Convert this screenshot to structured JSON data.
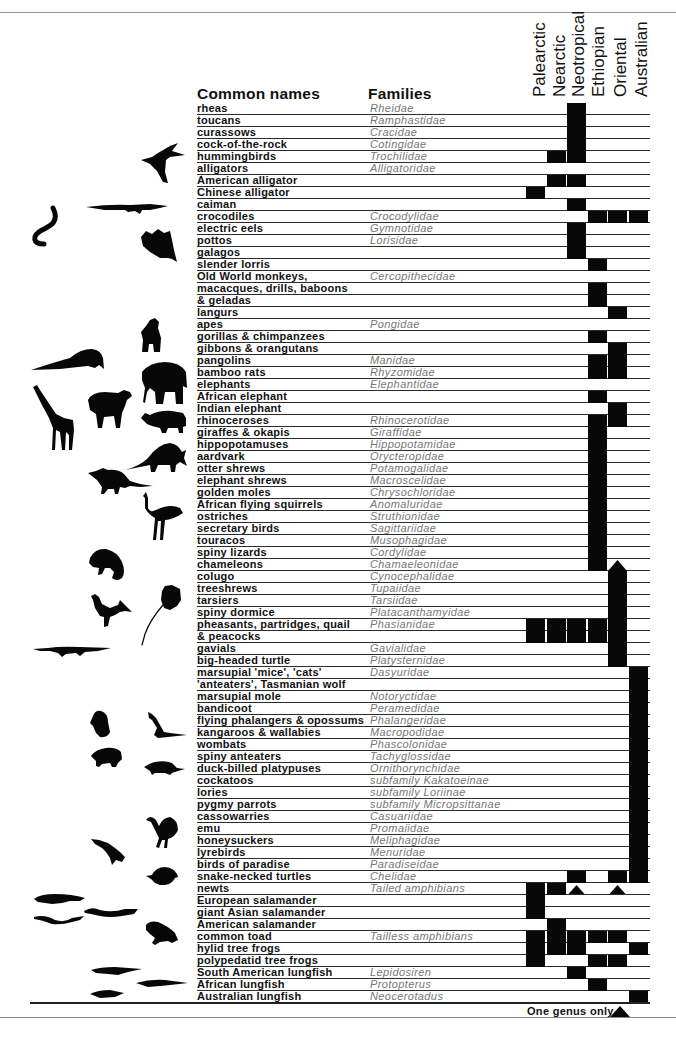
{
  "header": {
    "common_names": "Common names",
    "families": "Families"
  },
  "legend": {
    "label": "One genus only",
    "symbol": "triangle"
  },
  "icons": [
    "hummingbird-icon",
    "caiman-icon",
    "electric-eel-icon",
    "potto-icon",
    "gorilla-icon",
    "pangolin-icon",
    "indian-elephant-icon",
    "giraffe-icon",
    "african-elephant-icon",
    "rhinoceros-icon",
    "aardvark-icon",
    "elephant-shrew-icon",
    "ostrich-icon",
    "chameleon-icon",
    "pheasant-icon",
    "tarsier-icon",
    "gavial-icon",
    "koala-icon",
    "kangaroo-icon",
    "wombat-icon",
    "platypus-icon",
    "emu-icon",
    "bird-of-paradise-icon",
    "snake-necked-turtle-icon",
    "newt-icon",
    "salamander-icon",
    "giant-salamander-icon",
    "toad-icon",
    "south-american-lungfish-icon",
    "australian-lungfish-icon",
    "african-lungfish-icon"
  ],
  "chart_data": {
    "type": "table",
    "title": "",
    "columns": [
      "Palearctic",
      "Nearctic",
      "Neotropical",
      "Ethiopian",
      "Oriental",
      "Australian"
    ],
    "row_header_labels": [
      "Common names",
      "Families"
    ],
    "legend": [
      {
        "symbol": "filled square",
        "meaning": "present"
      },
      {
        "symbol": "triangle",
        "meaning": "One genus only"
      }
    ],
    "rows": [
      {
        "common_name": "rheas",
        "family": "Rheidae",
        "present": [
          "Neotropical"
        ]
      },
      {
        "common_name": "toucans",
        "family": "Ramphastidae",
        "present": [
          "Neotropical"
        ]
      },
      {
        "common_name": "curassows",
        "family": "Cracidae",
        "present": [
          "Neotropical"
        ]
      },
      {
        "common_name": "cock-of-the-rock",
        "family": "Cotingidae",
        "present": [
          "Neotropical"
        ]
      },
      {
        "common_name": "hummingbirds",
        "family": "Trochilidae",
        "present": [
          "Nearctic",
          "Neotropical"
        ]
      },
      {
        "common_name": "alligators",
        "family": "Alligatoridae",
        "present": []
      },
      {
        "common_name": "American alligator",
        "family": "",
        "present": [
          "Nearctic",
          "Neotropical"
        ]
      },
      {
        "common_name": "Chinese alligator",
        "family": "",
        "present": [
          "Palearctic"
        ]
      },
      {
        "common_name": "caiman",
        "family": "",
        "present": [
          "Neotropical"
        ]
      },
      {
        "common_name": "crocodiles",
        "family": "Crocodylidae",
        "present": [
          "Ethiopian",
          "Oriental",
          "Australian"
        ]
      },
      {
        "common_name": "electric eels",
        "family": "Gymnotidae",
        "present": [
          "Neotropical"
        ]
      },
      {
        "common_name": "pottos",
        "family": "Lorisidae",
        "present": [
          "Neotropical"
        ]
      },
      {
        "common_name": "galagos",
        "family": "",
        "present": [
          "Neotropical"
        ]
      },
      {
        "common_name": "slender lorris",
        "family": "",
        "present": [
          "Ethiopian"
        ]
      },
      {
        "common_name": "Old World monkeys,",
        "family": "Cercopithecidae",
        "present": []
      },
      {
        "common_name": "macacques, drills, baboons",
        "family": "",
        "present": [
          "Ethiopian"
        ]
      },
      {
        "common_name": "& geladas",
        "family": "",
        "present": [
          "Ethiopian"
        ]
      },
      {
        "common_name": "langurs",
        "family": "",
        "present": [
          "Oriental"
        ]
      },
      {
        "common_name": "apes",
        "family": "Pongidae",
        "present": []
      },
      {
        "common_name": "gorillas & chimpanzees",
        "family": "",
        "present": [
          "Ethiopian"
        ]
      },
      {
        "common_name": "gibbons & orangutans",
        "family": "",
        "present": [
          "Oriental"
        ]
      },
      {
        "common_name": "pangolins",
        "family": "Manidae",
        "present": [
          "Ethiopian",
          "Oriental"
        ]
      },
      {
        "common_name": "bamboo rats",
        "family": "Rhyzomidae",
        "present": [
          "Ethiopian",
          "Oriental"
        ]
      },
      {
        "common_name": "elephants",
        "family": "Elephantidae",
        "present": []
      },
      {
        "common_name": "African elephant",
        "family": "",
        "present": [
          "Ethiopian"
        ]
      },
      {
        "common_name": "Indian elephant",
        "family": "",
        "present": [
          "Oriental"
        ]
      },
      {
        "common_name": "rhinoceroses",
        "family": "Rhinocerotidae",
        "present": [
          "Ethiopian",
          "Oriental"
        ]
      },
      {
        "common_name": "giraffes & okapis",
        "family": "Giraffidae",
        "present": [
          "Ethiopian"
        ]
      },
      {
        "common_name": "hippopotamuses",
        "family": "Hippopotamidae",
        "present": [
          "Ethiopian"
        ]
      },
      {
        "common_name": "aardvark",
        "family": "Orycteropidae",
        "present": [
          "Ethiopian"
        ]
      },
      {
        "common_name": "otter shrews",
        "family": "Potamogalidae",
        "present": [
          "Ethiopian"
        ]
      },
      {
        "common_name": "elephant shrews",
        "family": "Macroscelidae",
        "present": [
          "Ethiopian"
        ]
      },
      {
        "common_name": "golden moles",
        "family": "Chrysochloridae",
        "present": [
          "Ethiopian"
        ]
      },
      {
        "common_name": "African flying squirrels",
        "family": "Anomaluridae",
        "present": [
          "Ethiopian"
        ]
      },
      {
        "common_name": "ostriches",
        "family": "Struthionidae",
        "present": [
          "Ethiopian"
        ]
      },
      {
        "common_name": "secretary birds",
        "family": "Sagittariidae",
        "present": [
          "Ethiopian"
        ]
      },
      {
        "common_name": "touracos",
        "family": "Musophagidae",
        "present": [
          "Ethiopian"
        ]
      },
      {
        "common_name": "spiny lizards",
        "family": "Cordylidae",
        "present": [
          "Ethiopian"
        ]
      },
      {
        "common_name": "chameleons",
        "family": "Chamaeleonidae",
        "present": [
          "Ethiopian"
        ]
      },
      {
        "common_name": "colugo",
        "family": "Cynocephalidae",
        "present": [
          "Oriental"
        ]
      },
      {
        "common_name": "treeshrews",
        "family": "Tupaiidae",
        "present": [
          "Oriental"
        ]
      },
      {
        "common_name": "tarsiers",
        "family": "Tarsiidae",
        "present": [
          "Oriental"
        ]
      },
      {
        "common_name": "spiny dormice",
        "family": "Platacanthamyidae",
        "present": [
          "Oriental"
        ]
      },
      {
        "common_name": "pheasants, partridges, quail",
        "family": "Phasianidae",
        "present": [
          "Palearctic",
          "Nearctic",
          "Neotropical",
          "Ethiopian",
          "Oriental"
        ]
      },
      {
        "common_name": "& peacocks",
        "family": "",
        "present": [
          "Palearctic",
          "Nearctic",
          "Neotropical",
          "Ethiopian",
          "Oriental"
        ]
      },
      {
        "common_name": "gavials",
        "family": "Gavialidae",
        "present": [
          "Oriental"
        ]
      },
      {
        "common_name": "big-headed turtle",
        "family": "Platysternidae",
        "present": [
          "Oriental"
        ]
      },
      {
        "common_name": "marsupial 'mice', 'cats'",
        "family": "Dasyuridae",
        "present": [
          "Australian"
        ]
      },
      {
        "common_name": "'anteaters', Tasmanian wolf",
        "family": "",
        "present": [
          "Australian"
        ]
      },
      {
        "common_name": "marsupial mole",
        "family": "Notoryctidae",
        "present": [
          "Australian"
        ]
      },
      {
        "common_name": "bandicoot",
        "family": "Peramedidae",
        "present": [
          "Australian"
        ]
      },
      {
        "common_name": "flying phalangers & opossums",
        "family": "Phalangeridae",
        "present": [
          "Australian"
        ]
      },
      {
        "common_name": "kangaroos & wallabies",
        "family": "Macropodidae",
        "present": [
          "Australian"
        ]
      },
      {
        "common_name": "wombats",
        "family": "Phascolonidae",
        "present": [
          "Australian"
        ]
      },
      {
        "common_name": "spiny anteaters",
        "family": "Tachyglossidae",
        "present": [
          "Australian"
        ]
      },
      {
        "common_name": "duck-billed platypuses",
        "family": "Ornithorynchidae",
        "present": [
          "Australian"
        ]
      },
      {
        "common_name": "cockatoos",
        "family": "subfamily Kakatoeinae",
        "present": [
          "Australian"
        ]
      },
      {
        "common_name": "lories",
        "family": "subfamily Loriinae",
        "present": [
          "Australian"
        ]
      },
      {
        "common_name": "pygmy parrots",
        "family": "subfamily Micropsittanae",
        "present": [
          "Australian"
        ]
      },
      {
        "common_name": "cassowarries",
        "family": "Casuariidae",
        "present": [
          "Australian"
        ]
      },
      {
        "common_name": "emu",
        "family": "Promaiidae",
        "present": [
          "Australian"
        ]
      },
      {
        "common_name": "honeysuckers",
        "family": "Meliphagidae",
        "present": [
          "Australian"
        ]
      },
      {
        "common_name": "lyrebirds",
        "family": "Menuridae",
        "present": [
          "Australian"
        ]
      },
      {
        "common_name": "birds of paradise",
        "family": "Paradiseidae",
        "present": [
          "Australian"
        ]
      },
      {
        "common_name": "snake-necked turtles",
        "family": "Chelidae",
        "present": [
          "Neotropical",
          "Oriental",
          "Australian"
        ]
      },
      {
        "common_name": "newts",
        "family": "Tailed amphibians",
        "present": [
          "Palearctic",
          "Nearctic"
        ],
        "one_genus_only": [
          "Neotropical",
          "Oriental"
        ]
      },
      {
        "common_name": "European salamander",
        "family": "",
        "present": [
          "Palearctic"
        ]
      },
      {
        "common_name": "giant Asian salamander",
        "family": "",
        "present": [
          "Palearctic"
        ]
      },
      {
        "common_name": "American salamander",
        "family": "",
        "present": [
          "Nearctic"
        ]
      },
      {
        "common_name": "common toad",
        "family": "Tailless amphibians",
        "present": [
          "Palearctic",
          "Nearctic",
          "Neotropical",
          "Ethiopian",
          "Oriental"
        ]
      },
      {
        "common_name": "hylid tree frogs",
        "family": "",
        "present": [
          "Palearctic",
          "Nearctic",
          "Neotropical",
          "Australian"
        ]
      },
      {
        "common_name": "polypedatid tree frogs",
        "family": "",
        "present": [
          "Palearctic",
          "Ethiopian",
          "Oriental"
        ]
      },
      {
        "common_name": "South American lungfish",
        "family": "Lepidosiren",
        "present": [
          "Neotropical"
        ]
      },
      {
        "common_name": "African lungfish",
        "family": "Protopterus",
        "present": [
          "Ethiopian"
        ]
      },
      {
        "common_name": "Australian lungfish",
        "family": "Neocerotadus",
        "present": [
          "Australian"
        ]
      }
    ],
    "annotations": [
      {
        "type": "arrow-up",
        "column": "Oriental",
        "row_index": 38,
        "note": "arrowhead topping Oriental bar (colugo to big-headed turtle)"
      }
    ]
  }
}
